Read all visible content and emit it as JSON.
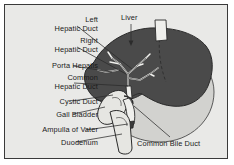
{
  "figure": {
    "kind": "anatomical-diagram",
    "background_color": "#e9e9e7",
    "border_color": "#3a3a3a",
    "text_color": "#1a1a1a"
  },
  "palette": {
    "liver": "#4a4a4a",
    "liver_outline": "#2a2a2a",
    "stomach": "#d2d2cf",
    "stomach_outline": "#4a4a4a",
    "duct": "#efefec",
    "duct_outline": "#2b2b2b",
    "gallbladder": "#e6e6e2",
    "leader": "#2b2b2b"
  },
  "labels": [
    {
      "id": "left-hepatic-duct",
      "line1": "Left",
      "line2": "Hepatic Duct",
      "align": "right",
      "x": 10,
      "y": 16,
      "w": 88
    },
    {
      "id": "right-hepatic-duct",
      "line1": "Right",
      "line2": "Hepatic Duct",
      "align": "right",
      "x": 10,
      "y": 37,
      "w": 88
    },
    {
      "id": "porta-hepatis",
      "line1": "Porta Hepatis",
      "line2": "",
      "align": "right",
      "x": 10,
      "y": 62,
      "w": 88
    },
    {
      "id": "common-hepatic-duct",
      "line1": "Common",
      "line2": "Hepatic Duct",
      "align": "right",
      "x": 10,
      "y": 74,
      "w": 88
    },
    {
      "id": "cystic-duct",
      "line1": "Cystic Duct",
      "line2": "",
      "align": "right",
      "x": 10,
      "y": 98,
      "w": 88
    },
    {
      "id": "gall-bladder",
      "line1": "Gall Bladder",
      "line2": "",
      "align": "right",
      "x": 10,
      "y": 111,
      "w": 88
    },
    {
      "id": "ampulla-of-vater",
      "line1": "Ampulla of Vater",
      "line2": "",
      "align": "right",
      "x": 4,
      "y": 126,
      "w": 94
    },
    {
      "id": "duodenum",
      "line1": "Duodenum",
      "line2": "",
      "align": "right",
      "x": 10,
      "y": 139,
      "w": 88
    },
    {
      "id": "liver",
      "line1": "Liver",
      "line2": "",
      "align": "left",
      "x": 121,
      "y": 14,
      "w": 40
    },
    {
      "id": "common-bile-duct",
      "line1": "Common Bile Duct",
      "line2": "",
      "align": "left",
      "x": 137,
      "y": 140,
      "w": 92
    }
  ],
  "leaders": [
    {
      "id": "leader-left-hepatic-duct",
      "points": "77,26 132,69"
    },
    {
      "id": "leader-right-hepatic-duct",
      "points": "77,47 126,74"
    },
    {
      "id": "leader-porta-hepatis",
      "points": "73,66 112,72"
    },
    {
      "id": "leader-common-hepatic-duct",
      "points": "74,83 128,86"
    },
    {
      "id": "leader-cystic-duct",
      "points": "72,101 113,95"
    },
    {
      "id": "leader-gall-bladder",
      "points": "73,114 105,107"
    },
    {
      "id": "leader-ampulla-of-vater",
      "points": "86,130 128,124"
    },
    {
      "id": "leader-duodenum",
      "points": "76,142 122,134"
    },
    {
      "id": "leader-liver",
      "points": "131,24 131,44"
    },
    {
      "id": "leader-common-bile-duct",
      "points": "170,137 134,106"
    }
  ]
}
